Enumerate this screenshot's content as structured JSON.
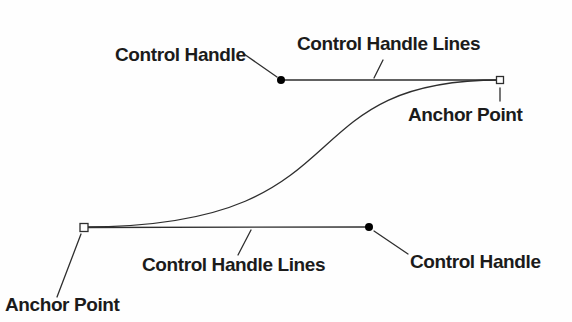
{
  "theme": {
    "background": "#fefefe",
    "line_color": "#2e2e2e",
    "text_color": "#1b1b1b",
    "marker_fill": "#000000",
    "anchor_fill": "#fefefe"
  },
  "labels": {
    "top_left_control_handle": "Control Handle",
    "top_control_handle_lines": "Control Handle Lines",
    "top_right_anchor_point": "Anchor Point",
    "bottom_control_handle_lines": "Control Handle Lines",
    "bottom_left_anchor_point": "Anchor Point",
    "bottom_right_control_handle": "Control Handle"
  },
  "diagram": {
    "paths": {
      "curve": "M 84 227 C 369 227 281 80 500 80",
      "handle_line_top": "M 281 80 L 500 80",
      "handle_line_bottom": "M 84 227.5 L 369 227",
      "leaders": "M 244 54 L 277 77 M 383 60 L 374 78 M 500 88 L 500 101 M 251 230 L 238 255 M 81 234 L 57 297 M 374 231 L 408 254"
    },
    "markers": {
      "control_top": {
        "cx": 281,
        "cy": 80,
        "r": 4
      },
      "control_bottom": {
        "cx": 369,
        "cy": 227,
        "r": 4
      },
      "anchor_top": {
        "x": 496.5,
        "y": 76.5,
        "width": 7,
        "height": 7
      },
      "anchor_bottom": {
        "x": 80,
        "y": 223.5,
        "width": 8,
        "height": 8
      }
    }
  }
}
